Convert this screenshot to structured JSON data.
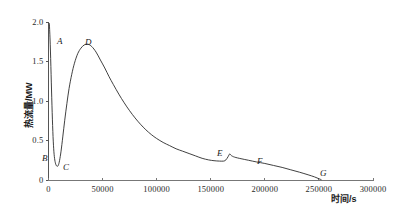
{
  "chart_data": {
    "type": "line",
    "title": "",
    "xlabel": "时间/s",
    "ylabel": "热流量/MW",
    "xlim": [
      0,
      300000
    ],
    "ylim": [
      0,
      2.0
    ],
    "grid": false,
    "legend": "none",
    "x_ticks": [
      {
        "value": 0,
        "label": "0"
      },
      {
        "value": 50000,
        "label": "50000"
      },
      {
        "value": 100000,
        "label": "100000"
      },
      {
        "value": 150000,
        "label": "150000"
      },
      {
        "value": 200000,
        "label": "200000"
      },
      {
        "value": 250000,
        "label": "250000"
      },
      {
        "value": 300000,
        "label": "300000"
      }
    ],
    "y_ticks": [
      {
        "value": 0,
        "label": "0"
      },
      {
        "value": 0.5,
        "label": "0.5"
      },
      {
        "value": 1.0,
        "label": "1.0"
      },
      {
        "value": 1.5,
        "label": "1.5"
      },
      {
        "value": 2.0,
        "label": "2.0"
      }
    ],
    "series": [
      {
        "name": "热流量",
        "color": "#2b2b2b",
        "points": [
          [
            800,
            1.98
          ],
          [
            1600,
            1.72
          ],
          [
            2400,
            1.34
          ],
          [
            3200,
            0.95
          ],
          [
            4000,
            0.62
          ],
          [
            4800,
            0.4
          ],
          [
            5600,
            0.28
          ],
          [
            6600,
            0.21
          ],
          [
            7800,
            0.18
          ],
          [
            9000,
            0.19
          ],
          [
            10200,
            0.25
          ],
          [
            11600,
            0.37
          ],
          [
            13200,
            0.55
          ],
          [
            15000,
            0.76
          ],
          [
            17000,
            0.97
          ],
          [
            19000,
            1.16
          ],
          [
            21500,
            1.34
          ],
          [
            24000,
            1.48
          ],
          [
            27000,
            1.6
          ],
          [
            30000,
            1.67
          ],
          [
            33000,
            1.71
          ],
          [
            36500,
            1.72
          ],
          [
            40000,
            1.69
          ],
          [
            44000,
            1.62
          ],
          [
            48000,
            1.52
          ],
          [
            52000,
            1.42
          ],
          [
            56000,
            1.31
          ],
          [
            60000,
            1.21
          ],
          [
            65000,
            1.09
          ],
          [
            70000,
            0.98
          ],
          [
            75000,
            0.88
          ],
          [
            80000,
            0.79
          ],
          [
            85000,
            0.71
          ],
          [
            90000,
            0.64
          ],
          [
            95000,
            0.58
          ],
          [
            100000,
            0.53
          ],
          [
            106000,
            0.48
          ],
          [
            112000,
            0.44
          ],
          [
            118000,
            0.4
          ],
          [
            124000,
            0.37
          ],
          [
            130000,
            0.34
          ],
          [
            136000,
            0.31
          ],
          [
            142000,
            0.28
          ],
          [
            148000,
            0.26
          ],
          [
            153000,
            0.25
          ],
          [
            158000,
            0.245
          ],
          [
            162000,
            0.245
          ],
          [
            164000,
            0.26
          ],
          [
            166000,
            0.3
          ],
          [
            167500,
            0.335
          ],
          [
            169000,
            0.315
          ],
          [
            172000,
            0.295
          ],
          [
            178000,
            0.275
          ],
          [
            185000,
            0.255
          ],
          [
            192000,
            0.235
          ],
          [
            200000,
            0.215
          ],
          [
            208000,
            0.19
          ],
          [
            216000,
            0.165
          ],
          [
            224000,
            0.135
          ],
          [
            232000,
            0.105
          ],
          [
            240000,
            0.072
          ],
          [
            246000,
            0.045
          ],
          [
            250000,
            0.022
          ],
          [
            252000,
            0.012
          ]
        ]
      }
    ],
    "annotations": [
      {
        "label": "A",
        "x": 2500,
        "y": 1.82,
        "px": 57,
        "py": 36
      },
      {
        "label": "B",
        "x": 1000,
        "y": 0.4,
        "px": 42,
        "py": 153
      },
      {
        "label": "C",
        "x": 13500,
        "y": 0.22,
        "px": 63,
        "py": 162
      },
      {
        "label": "D",
        "x": 31000,
        "y": 1.88,
        "px": 85,
        "py": 37
      },
      {
        "label": "E",
        "x": 166000,
        "y": 0.44,
        "px": 217,
        "py": 148
      },
      {
        "label": "F",
        "x": 198000,
        "y": 0.38,
        "px": 257,
        "py": 156
      },
      {
        "label": "G",
        "x": 252000,
        "y": 0.16,
        "px": 320,
        "py": 168
      }
    ]
  }
}
